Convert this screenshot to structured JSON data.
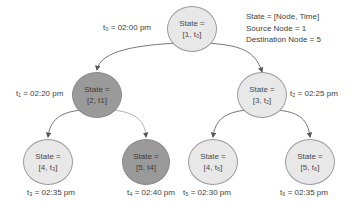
{
  "legend": {
    "line1": "State = [Node, Time]",
    "line2": "Source Node = 1",
    "line3": "Destination Node = 5"
  },
  "nodes": [
    {
      "id": "n1",
      "line1": "State =",
      "line2": "[1, t₀]",
      "time_label": "t₀ = 02:00 pm",
      "shade": "light"
    },
    {
      "id": "n2",
      "line1": "State =",
      "line2": "[2, t1]",
      "time_label": "t₁ = 02:20 pm",
      "shade": "dark"
    },
    {
      "id": "n3",
      "line1": "State =",
      "line2": "[3, t₂]",
      "time_label": "t₂ = 02:25 pm",
      "shade": "light"
    },
    {
      "id": "n4a",
      "line1": "State =",
      "line2": "[4, t₃]",
      "time_label": "t₃ = 02:35 pm",
      "shade": "light"
    },
    {
      "id": "n5a",
      "line1": "State =",
      "line2": "[5, t4]",
      "time_label": "t₄ = 02:40 pm",
      "shade": "dark"
    },
    {
      "id": "n4b",
      "line1": "State =",
      "line2": "[4, t₅]",
      "time_label": "t₅ = 02:30 pm",
      "shade": "light"
    },
    {
      "id": "n5b",
      "line1": "State =",
      "line2": "[5, t₆]",
      "time_label": "t₆ = 02:35 pm",
      "shade": "light"
    }
  ],
  "edges": [
    {
      "from": "n1",
      "to": "n2"
    },
    {
      "from": "n1",
      "to": "n3"
    },
    {
      "from": "n2",
      "to": "n4a"
    },
    {
      "from": "n2",
      "to": "n5a"
    },
    {
      "from": "n3",
      "to": "n4b"
    },
    {
      "from": "n3",
      "to": "n5b"
    }
  ],
  "colors": {
    "light_node": "#e8e8e8",
    "dark_node": "#9a9a9a",
    "edge": "#555555"
  }
}
